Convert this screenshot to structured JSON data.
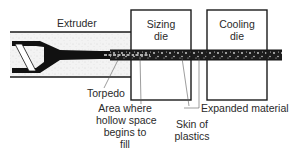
{
  "diagram": {
    "type": "extrusion-process-schematic",
    "components": {
      "extruder": {
        "label": "Extruder"
      },
      "sizing_die": {
        "label_line1": "Sizing",
        "label_line2": "die"
      },
      "cooling_die": {
        "label_line1": "Cooling",
        "label_line2": "die"
      }
    },
    "callouts": {
      "torpedo": "Torpedo",
      "area": {
        "line1": "Area where",
        "line2": "hollow space",
        "line3": "begins to",
        "line4": "fill"
      },
      "skin": {
        "line1": "Skin of",
        "line2": "plastics"
      },
      "expanded": "Expanded material"
    },
    "colors": {
      "line": "#1a1a1a",
      "melt_fill": "#efefef",
      "torpedo": "#111111",
      "leader": "#555555"
    }
  }
}
